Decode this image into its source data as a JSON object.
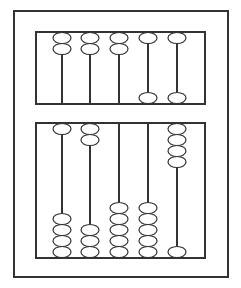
{
  "diagram": {
    "type": "abacus",
    "colors": {
      "stroke": "#333333",
      "background": "#ffffff",
      "bead_fill": "#ffffff"
    },
    "outer_frame": {
      "x": 14,
      "y": 11,
      "w": 214,
      "h": 266
    },
    "upper_deck": {
      "x": 36,
      "y": 32,
      "w": 169,
      "h": 72
    },
    "lower_deck": {
      "x": 36,
      "y": 123,
      "w": 169,
      "h": 135
    },
    "rod_x": [
      62,
      90,
      119,
      148,
      177
    ],
    "bead": {
      "rx": 9,
      "ry": 5.5,
      "pitch": 11
    },
    "upper_columns": [
      {
        "top": 2,
        "bottom": 0
      },
      {
        "top": 2,
        "bottom": 0
      },
      {
        "top": 2,
        "bottom": 0
      },
      {
        "top": 1,
        "bottom": 1
      },
      {
        "top": 1,
        "bottom": 1
      }
    ],
    "lower_columns": [
      {
        "top": 1,
        "bottom": 4
      },
      {
        "top": 2,
        "bottom": 3
      },
      {
        "top": 0,
        "bottom": 5
      },
      {
        "top": 0,
        "bottom": 5
      },
      {
        "top": 4,
        "bottom": 1
      }
    ]
  }
}
